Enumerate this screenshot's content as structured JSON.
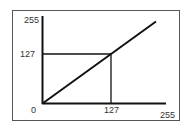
{
  "chart_data": {
    "type": "line",
    "title": "",
    "xlabel": "",
    "ylabel": "",
    "xlim": [
      0,
      255
    ],
    "ylim": [
      0,
      255
    ],
    "x_ticks": [
      "0",
      "127",
      "255"
    ],
    "y_ticks": [
      "0",
      "127",
      "255"
    ],
    "series": [
      {
        "name": "identity",
        "x": [
          0,
          255
        ],
        "y": [
          0,
          255
        ]
      }
    ],
    "guide_point": {
      "x": 127,
      "y": 127
    },
    "labels": {
      "origin": "0",
      "x_mid": "127",
      "x_max": "255",
      "y_mid": "127",
      "y_max": "255"
    },
    "colors": {
      "line": "#111111",
      "border": "#555555"
    }
  }
}
